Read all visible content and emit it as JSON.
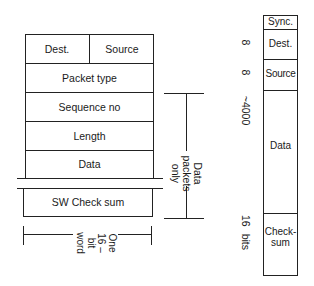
{
  "left_frame": {
    "rows": [
      {
        "cells": [
          "Dest.",
          "Source"
        ]
      },
      {
        "cells": [
          "Packet type"
        ]
      },
      {
        "cells": [
          "Sequence no"
        ]
      },
      {
        "cells": [
          "Length"
        ]
      },
      {
        "cells": [
          "Data"
        ]
      },
      {
        "cells": [
          "SW Check sum"
        ]
      }
    ],
    "bracket_label": "Data packets only",
    "bracket_label_lines": [
      "Data",
      "packets",
      "only"
    ],
    "width_label_lines": [
      "One",
      "16 –",
      "bit",
      "word"
    ]
  },
  "right_frame": {
    "fields": [
      {
        "name": "Sync.",
        "size": ""
      },
      {
        "name": "Dest.",
        "size": "8"
      },
      {
        "name": "Source",
        "size": "8"
      },
      {
        "name": "Data",
        "size": "~4000"
      },
      {
        "name": "Check-\nsum",
        "name_lines": [
          "Check-",
          "sum"
        ],
        "size": "16 bits"
      }
    ]
  }
}
